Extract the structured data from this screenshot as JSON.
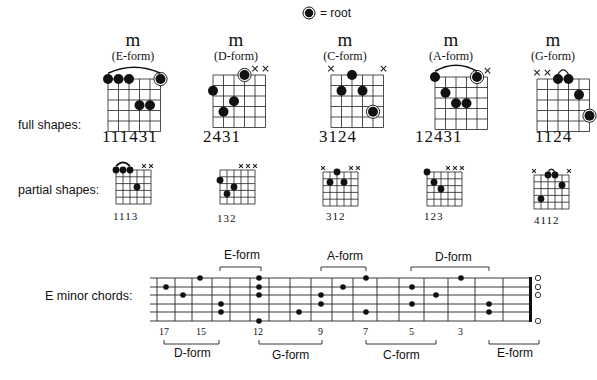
{
  "legend": {
    "icon": "root-marker-icon",
    "label": "= root"
  },
  "rows": {
    "full": "full shapes:",
    "partial": "partial shapes:",
    "fretboard": "E minor chords:"
  },
  "full_shapes": [
    {
      "symbol": "m",
      "form": "(E-form)",
      "fingering": "111431",
      "muted": [],
      "barre": true,
      "dots": [
        [
          0,
          0
        ],
        [
          1,
          0
        ],
        [
          2,
          0
        ],
        [
          5,
          0,
          "root"
        ],
        [
          3,
          2
        ],
        [
          4,
          2
        ]
      ]
    },
    {
      "symbol": "m",
      "form": "(D-form)",
      "fingering": "2431",
      "muted": [
        4,
        5
      ],
      "barre": false,
      "dots": [
        [
          3,
          0,
          "root"
        ],
        [
          0,
          1
        ],
        [
          2,
          2
        ],
        [
          1,
          3
        ]
      ]
    },
    {
      "symbol": "m",
      "form": "(C-form)",
      "fingering": "3124",
      "muted": [
        0,
        5
      ],
      "barre": false,
      "dots": [
        [
          2,
          0
        ],
        [
          1,
          1
        ],
        [
          3,
          1
        ],
        [
          4,
          3,
          "root"
        ]
      ]
    },
    {
      "symbol": "m",
      "form": "(A-form)",
      "fingering": "12431",
      "muted": [
        5
      ],
      "barre": true,
      "dots": [
        [
          0,
          0
        ],
        [
          4,
          0,
          "root"
        ],
        [
          1,
          1
        ],
        [
          2,
          2
        ],
        [
          3,
          2
        ]
      ]
    },
    {
      "symbol": "m",
      "form": "(G-form)",
      "fingering": "1124",
      "muted": [
        0,
        1
      ],
      "barre": "small",
      "dots": [
        [
          2,
          0
        ],
        [
          3,
          0
        ],
        [
          4,
          1
        ],
        [
          5,
          3,
          "root"
        ]
      ]
    }
  ],
  "partial_shapes": [
    {
      "fingering": "1113",
      "muted": [
        4,
        5
      ],
      "barre": true,
      "dots": [
        [
          0,
          0
        ],
        [
          1,
          0
        ],
        [
          2,
          0
        ],
        [
          3,
          2
        ]
      ]
    },
    {
      "fingering": "132",
      "muted": [
        3,
        4,
        5
      ],
      "barre": false,
      "dots": [
        [
          0,
          1
        ],
        [
          2,
          2
        ],
        [
          1,
          3
        ]
      ]
    },
    {
      "fingering": "312",
      "muted": [
        0,
        4,
        5
      ],
      "barre": false,
      "dots": [
        [
          2,
          0
        ],
        [
          1,
          1
        ],
        [
          3,
          1
        ]
      ]
    },
    {
      "fingering": "123",
      "muted": [
        3,
        4,
        5
      ],
      "barre": false,
      "dots": [
        [
          0,
          0
        ],
        [
          1,
          1
        ],
        [
          2,
          2
        ]
      ]
    },
    {
      "fingering": "4112",
      "muted": [
        0,
        5
      ],
      "barre": "small",
      "dots": [
        [
          2,
          0
        ],
        [
          3,
          0
        ],
        [
          4,
          1
        ],
        [
          1,
          3
        ]
      ]
    }
  ],
  "fretboard": {
    "fret_numbers": [
      {
        "label": "17",
        "x": 166
      },
      {
        "label": "15",
        "x": 203
      },
      {
        "label": "12",
        "x": 259
      },
      {
        "label": "9",
        "x": 321
      },
      {
        "label": "7",
        "x": 366
      },
      {
        "label": "5",
        "x": 412
      },
      {
        "label": "3",
        "x": 461
      }
    ],
    "forms_above": [
      {
        "label": "E-form",
        "x1": 220,
        "x2": 261
      },
      {
        "label": "A-form",
        "x1": 321,
        "x2": 366
      },
      {
        "label": "D-form",
        "x1": 411,
        "x2": 489
      }
    ],
    "forms_below": [
      {
        "label": "D-form",
        "x1": 164,
        "x2": 219
      },
      {
        "label": "G-form",
        "x1": 259,
        "x2": 322
      },
      {
        "label": "C-form",
        "x1": 366,
        "x2": 436
      },
      {
        "label": "E-form",
        "x1": 489,
        "x2": 539
      }
    ],
    "dots": [
      [
        200,
        0
      ],
      [
        166,
        1
      ],
      [
        183,
        2
      ],
      [
        221,
        3
      ],
      [
        221,
        4
      ],
      [
        259,
        0
      ],
      [
        259,
        1
      ],
      [
        259,
        2
      ],
      [
        259,
        5
      ],
      [
        299,
        4
      ],
      [
        321,
        2
      ],
      [
        321,
        3
      ],
      [
        343,
        1
      ],
      [
        366,
        0
      ],
      [
        366,
        4
      ],
      [
        412,
        1
      ],
      [
        412,
        3
      ],
      [
        436,
        2
      ],
      [
        461,
        0
      ],
      [
        489,
        3
      ],
      [
        489,
        4
      ]
    ],
    "open_strings": [
      0,
      1,
      2,
      5
    ]
  }
}
